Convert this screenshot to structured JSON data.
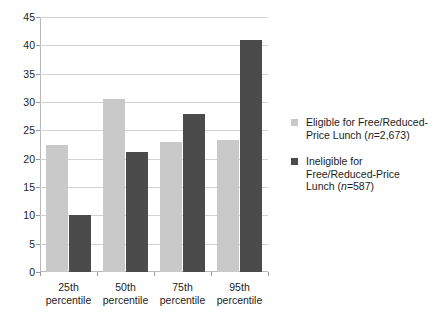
{
  "figure": {
    "title_remnant": "",
    "background": "#ffffff"
  },
  "chart_data": {
    "type": "bar",
    "title": "",
    "subtitle": "",
    "xlabel": "",
    "ylabel": "",
    "categories": [
      "25th percentile",
      "50th percentile",
      "75th percentile",
      "95th percentile"
    ],
    "category_lines": [
      [
        "25th",
        "percentile"
      ],
      [
        "50th",
        "percentile"
      ],
      [
        "75th",
        "percentile"
      ],
      [
        "95th",
        "percentile"
      ]
    ],
    "series": [
      {
        "name": "Eligible for Free/Reduced-Price Lunch (n=2,673)",
        "color": "#c9c9c9",
        "values": [
          22.5,
          30.5,
          22.9,
          23.3
        ]
      },
      {
        "name": "Ineligible for Free/Reduced-Price Lunch (n=587)",
        "color": "#4b4b4b",
        "values": [
          10.0,
          21.2,
          27.8,
          40.9
        ]
      }
    ],
    "ylim": [
      0,
      45
    ],
    "ytick_step": 5,
    "yticks": [
      0,
      5,
      10,
      15,
      20,
      25,
      30,
      35,
      40,
      45
    ],
    "ytick_labels": [
      "0",
      "5",
      "10",
      "15",
      "20",
      "25",
      "30",
      "35",
      "40",
      "45"
    ],
    "grid": true,
    "grid_color": "#d2d2d2",
    "legend_position": "right"
  },
  "legend": {
    "items": [
      {
        "swatch": "light",
        "color": "#c9c9c9",
        "line1_pre": "Eligible for Free/Reduced-",
        "line2_pre": "Price Lunch (",
        "n_italic": "n",
        "n_value": "=2,673)",
        "full": "Eligible for Free/Reduced-Price Lunch (n=2,673)"
      },
      {
        "swatch": "dark",
        "color": "#4b4b4b",
        "line1_pre": "Ineligible for",
        "line2_pre": "Free/Reduced-Price",
        "line3_pre": "Lunch (",
        "n_italic": "n",
        "n_value": "=587)",
        "full": "Ineligible for Free/Reduced-Price Lunch (n=587)"
      }
    ]
  }
}
